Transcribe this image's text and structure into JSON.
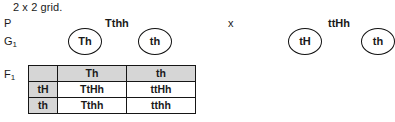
{
  "caption": "2 x 2 grid.",
  "labels": {
    "parents": "P",
    "gametes_base": "G",
    "gametes_sub": "1",
    "offspring_base": "F",
    "offspring_sub": "1"
  },
  "cross": {
    "parent_left_genotype": "Tthh",
    "cross_symbol": "x",
    "parent_right_genotype": "ttHh"
  },
  "gametes": [
    {
      "label": "Th"
    },
    {
      "label": "th"
    },
    {
      "label": "tH"
    },
    {
      "label": "th"
    }
  ],
  "punnett": {
    "corner": "",
    "column_headers": [
      "Th",
      "th"
    ],
    "row_headers": [
      "tH",
      "th"
    ],
    "cells": [
      [
        "TtHh",
        "ttHh"
      ],
      [
        "Tthh",
        "tthh"
      ]
    ]
  },
  "colors": {
    "header_fill": "#d6d6d6",
    "border": "#161616",
    "text": "#1a1a1a",
    "background": "#ffffff"
  }
}
